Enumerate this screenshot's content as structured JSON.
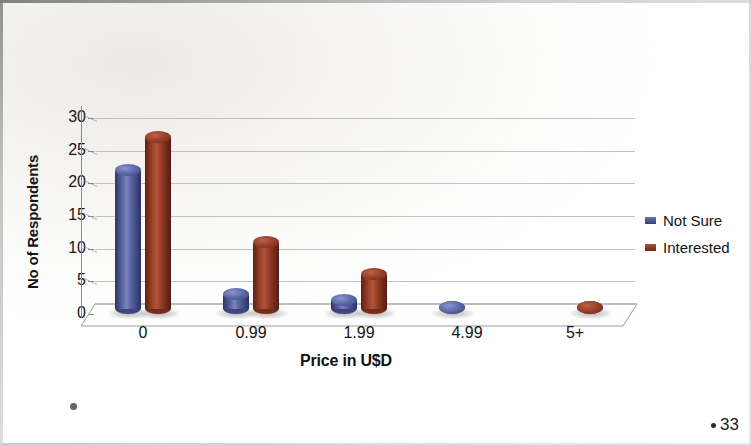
{
  "slide": {
    "page_number": "33"
  },
  "legend": {
    "position": "right",
    "items": [
      {
        "label": "Not Sure",
        "color": "#4a5390"
      },
      {
        "label": "Interested",
        "color": "#8f3a26"
      }
    ]
  },
  "chart_data": {
    "type": "bar",
    "title": "",
    "subtitle": "",
    "xlabel": "Price in U$D",
    "ylabel": "No of Respondents",
    "categories": [
      "0",
      "0.99",
      "1.99",
      "4.99",
      "5+"
    ],
    "series": [
      {
        "name": "Not Sure",
        "color": "#4a5390",
        "values": [
          23,
          4,
          3,
          1,
          0
        ]
      },
      {
        "name": "Interested",
        "color": "#8f3a26",
        "values": [
          28,
          12,
          7,
          0,
          1
        ]
      }
    ],
    "ylim": [
      0,
      30
    ],
    "ytick_labels": [
      "0",
      "5",
      "10",
      "15",
      "20",
      "25",
      "30"
    ],
    "ytick_values": [
      0,
      5,
      10,
      15,
      20,
      25,
      30
    ],
    "grid": true,
    "style_3d": true,
    "legend_position": "right"
  }
}
